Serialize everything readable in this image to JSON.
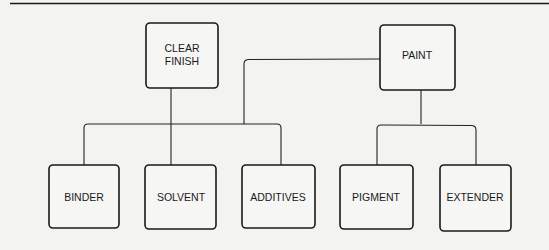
{
  "diagram": {
    "type": "hierarchy",
    "parents": [
      {
        "id": "clear_finish",
        "label_lines": [
          "CLEAR",
          "FINISH"
        ],
        "children": [
          "binder",
          "solvent",
          "additives"
        ]
      },
      {
        "id": "paint",
        "label_lines": [
          "PAINT"
        ],
        "children": [
          "binder",
          "solvent",
          "additives",
          "pigment",
          "extender"
        ]
      }
    ],
    "nodes": {
      "clear_finish": {
        "label": "CLEAR FINISH",
        "line1": "CLEAR",
        "line2": "FINISH"
      },
      "paint": {
        "label": "PAINT"
      },
      "binder": {
        "label": "BINDER"
      },
      "solvent": {
        "label": "SOLVENT"
      },
      "additives": {
        "label": "ADDITIVES"
      },
      "pigment": {
        "label": "PIGMENT"
      },
      "extender": {
        "label": "EXTENDER"
      }
    },
    "edges": [
      {
        "from": "clear_finish",
        "to": "binder"
      },
      {
        "from": "clear_finish",
        "to": "solvent"
      },
      {
        "from": "clear_finish",
        "to": "additives"
      },
      {
        "from": "paint",
        "to": "clear_finish_group",
        "note": "PAINT includes the clear-finish components"
      },
      {
        "from": "paint",
        "to": "pigment"
      },
      {
        "from": "paint",
        "to": "extender"
      }
    ]
  }
}
